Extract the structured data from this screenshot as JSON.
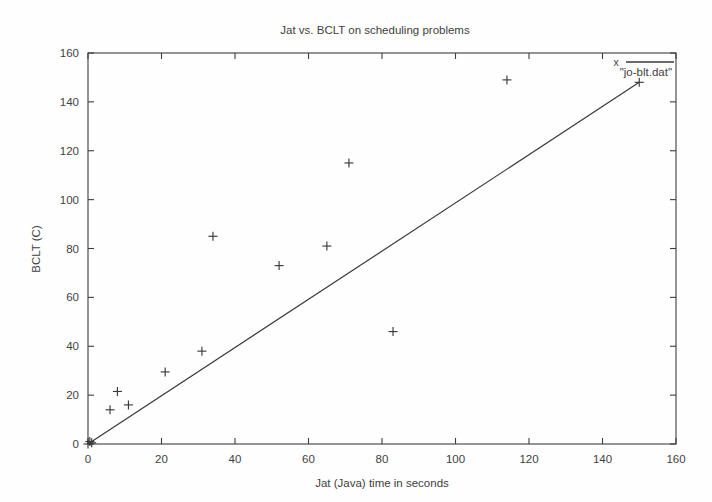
{
  "chart_data": {
    "type": "scatter",
    "title": "Jat vs. BCLT on scheduling problems",
    "xlabel": "Jat (Java) time in seconds",
    "ylabel": "BCLT (C)",
    "xlim": [
      0,
      160
    ],
    "ylim": [
      0,
      160
    ],
    "xticks": [
      0,
      20,
      40,
      60,
      80,
      100,
      120,
      140,
      160
    ],
    "yticks": [
      0,
      20,
      40,
      60,
      80,
      100,
      120,
      140,
      160
    ],
    "grid": false,
    "legend": {
      "position": "top-right-inside",
      "entries": [
        {
          "label": "\"jo-blt.dat\"",
          "marker": "x",
          "marker_glyph": "x",
          "line": true
        }
      ]
    },
    "series": [
      {
        "name": "\"jo-blt.dat\"",
        "marker": "plus",
        "points": [
          {
            "x": 0,
            "y": 0
          },
          {
            "x": 0.5,
            "y": 1
          },
          {
            "x": 1,
            "y": 0.5
          },
          {
            "x": 6,
            "y": 14
          },
          {
            "x": 8,
            "y": 21.5
          },
          {
            "x": 11,
            "y": 16
          },
          {
            "x": 21,
            "y": 29.5
          },
          {
            "x": 31,
            "y": 38
          },
          {
            "x": 34,
            "y": 85
          },
          {
            "x": 52,
            "y": 73
          },
          {
            "x": 65,
            "y": 81
          },
          {
            "x": 71,
            "y": 115
          },
          {
            "x": 83,
            "y": 46
          },
          {
            "x": 114,
            "y": 149
          },
          {
            "x": 150,
            "y": 148
          }
        ]
      }
    ],
    "fit_line": {
      "description": "diagonal reference line from origin to the rightmost data point",
      "x0": 0,
      "y0": 0,
      "x1": 150,
      "y1": 148
    },
    "colors": {
      "background": "#fefefe",
      "foreground": "#3a3a3a",
      "axis": "#3d3d3d"
    }
  }
}
